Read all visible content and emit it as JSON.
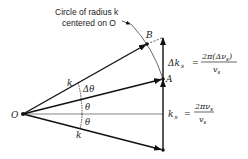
{
  "caption": {
    "line1": "Circle of radius k",
    "line2": "centered on O"
  },
  "points": {
    "origin": "O",
    "a": "A",
    "b": "B"
  },
  "angles": {
    "delta_theta": "Δθ",
    "theta_upper": "θ",
    "theta_lower": "θ"
  },
  "vectors": {
    "k_upper": "k",
    "k_lower": "k"
  },
  "equations": {
    "delta_ks": {
      "lhs": "Δk",
      "lhs_sub": "s",
      "eq": "=",
      "numerator": "2π(Δν",
      "numerator_sub": "s",
      "numerator_close": ")",
      "denominator": "v",
      "denominator_sub": "s"
    },
    "ks": {
      "lhs": "k",
      "lhs_sub": "s",
      "eq": "=",
      "numerator": "2πν",
      "numerator_sub": "s",
      "denominator": "v",
      "denominator_sub": "s"
    }
  },
  "colors": {
    "line": "#111111",
    "thin": "#555555"
  }
}
